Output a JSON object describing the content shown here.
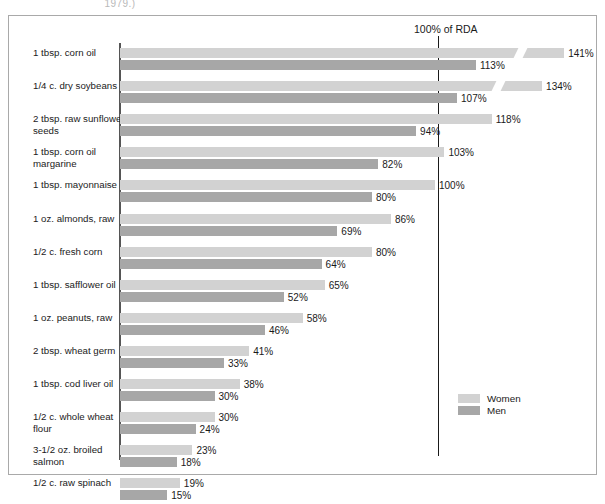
{
  "caption_fragment": "1979.)",
  "rda_marker_label": "100% of RDA",
  "legend": {
    "position": "inside-right",
    "entries": [
      {
        "label": "Women",
        "color": "#d2d2d2"
      },
      {
        "label": "Men",
        "color": "#a7a7a7"
      }
    ]
  },
  "colors": {
    "women": "#d2d2d2",
    "men": "#a7a7a7",
    "rda_line": "#1a1a1a",
    "axis": "#555555",
    "frame": "#a9a9a9",
    "background": "#ffffff"
  },
  "chart_data": {
    "type": "bar",
    "orientation": "horizontal",
    "title": "",
    "subtitle": "",
    "xlabel": "",
    "ylabel": "",
    "xlim": [
      0,
      141
    ],
    "grid": false,
    "reference_line": {
      "value": 100,
      "label": "100% of RDA"
    },
    "value_suffix": "%",
    "categories": [
      "1 tbsp. corn oil",
      "1/4 c. dry soybeans",
      "2 tbsp. raw sunflower seeds",
      "1 tbsp. corn oil margarine",
      "1 tbsp. mayonnaise",
      "1 oz. almonds, raw",
      "1/2 c. fresh corn",
      "1 tbsp. safflower oil",
      "1 oz. peanuts, raw",
      "2 tbsp. wheat germ",
      "1 tbsp. cod liver oil",
      "1/2 c. whole wheat flour",
      "3-1/2 oz. broiled salmon",
      "1/2 c. raw spinach"
    ],
    "series": [
      {
        "name": "Women",
        "color": "#d2d2d2",
        "values": [
          141,
          134,
          118,
          103,
          100,
          86,
          80,
          65,
          58,
          41,
          38,
          30,
          23,
          19
        ],
        "labels": [
          "141%",
          "134%",
          "118%",
          "103%",
          "100%",
          "86%",
          "80%",
          "65%",
          "58%",
          "41%",
          "38%",
          "30%",
          "23%",
          "19%"
        ]
      },
      {
        "name": "Men",
        "color": "#a7a7a7",
        "values": [
          113,
          107,
          94,
          82,
          80,
          69,
          64,
          52,
          46,
          33,
          30,
          24,
          18,
          15
        ],
        "labels": [
          "113%",
          "107%",
          "94%",
          "82%",
          "80%",
          "69%",
          "64%",
          "52%",
          "46%",
          "33%",
          "30%",
          "24%",
          "18%",
          "15%"
        ]
      }
    ]
  }
}
